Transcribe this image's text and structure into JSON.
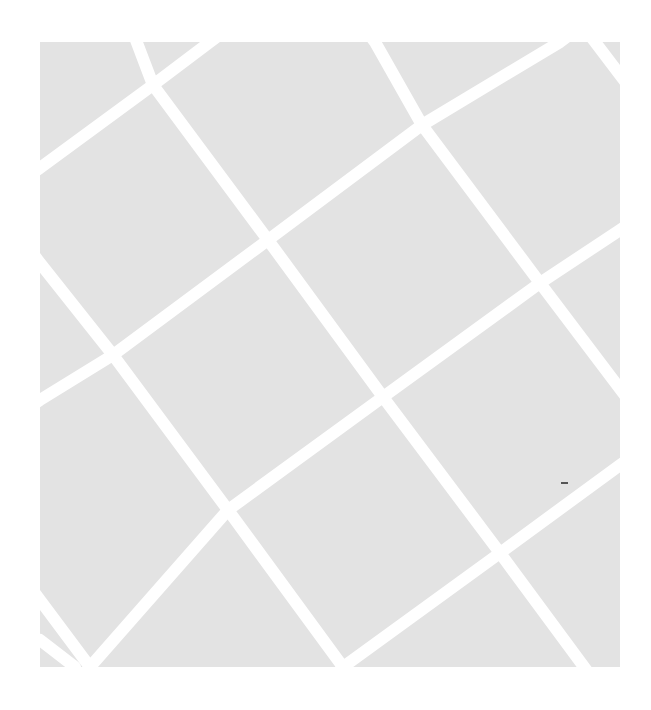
{
  "image": {
    "description": "Grey square tile crossed by a rotated grid of white lines",
    "width": 651,
    "height": 710,
    "background_color": "#ffffff",
    "tile": {
      "x": 40,
      "y": 42,
      "width": 580,
      "height": 625,
      "color": "#e3e3e3"
    },
    "line_color": "#ffffff",
    "line_width": 12,
    "lines_descending": [
      [
        [
          120,
          -2
        ],
        [
          153,
          85
        ],
        [
          268,
          240
        ],
        [
          383,
          397
        ],
        [
          500,
          553
        ],
        [
          590,
          675
        ]
      ],
      [
        [
          362,
          25
        ],
        [
          375,
          42
        ],
        [
          422,
          125
        ],
        [
          540,
          283
        ],
        [
          636,
          410
        ]
      ],
      [
        [
          28,
          247
        ],
        [
          40,
          263
        ],
        [
          113,
          355
        ],
        [
          228,
          510
        ],
        [
          343,
          667
        ],
        [
          350,
          680
        ]
      ],
      [
        [
          583,
          26
        ],
        [
          595,
          42
        ],
        [
          620,
          75
        ],
        [
          630,
          88
        ]
      ],
      [
        [
          28,
          584
        ],
        [
          40,
          600
        ],
        [
          90,
          667
        ],
        [
          98,
          678
        ]
      ]
    ],
    "lines_ascending": [
      [
        [
          28,
          176
        ],
        [
          40,
          168
        ],
        [
          153,
          85
        ],
        [
          210,
          42
        ],
        [
          226,
          30
        ]
      ],
      [
        [
          28,
          408
        ],
        [
          40,
          400
        ],
        [
          113,
          355
        ],
        [
          268,
          240
        ],
        [
          422,
          125
        ],
        [
          560,
          42
        ],
        [
          576,
          30
        ]
      ],
      [
        [
          80,
          679
        ],
        [
          90,
          667
        ],
        [
          228,
          510
        ],
        [
          383,
          397
        ],
        [
          540,
          283
        ],
        [
          620,
          230
        ],
        [
          634,
          221
        ]
      ],
      [
        [
          333,
          679
        ],
        [
          343,
          667
        ],
        [
          500,
          553
        ],
        [
          620,
          465
        ],
        [
          634,
          455
        ]
      ],
      [
        [
          28,
          648
        ],
        [
          40,
          640
        ],
        [
          75,
          667
        ],
        [
          60,
          679
        ]
      ]
    ],
    "marks": [
      {
        "name": "small-dash",
        "x": 561,
        "y": 482,
        "width": 7,
        "height": 2,
        "color": "#555555"
      }
    ]
  }
}
